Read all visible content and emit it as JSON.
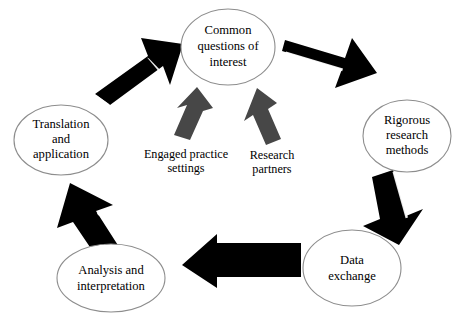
{
  "diagram": {
    "background_color": "#ffffff",
    "node_fill_color": "#ffffff",
    "node_stroke_color": "#8d8d8d",
    "arrow_color": "#000000",
    "input_arrow_color": "#474747",
    "nodes": [
      {
        "id": "common-questions",
        "label_lines": [
          "Common",
          "questions of",
          "interest"
        ],
        "position": "top-center"
      },
      {
        "id": "rigorous-research-methods",
        "label_lines": [
          "Rigorous",
          "research",
          "methods"
        ],
        "position": "right"
      },
      {
        "id": "data-exchange",
        "label_lines": [
          "Data",
          "exchange"
        ],
        "position": "bottom-right"
      },
      {
        "id": "analysis-interpretation",
        "label_lines": [
          "Analysis and",
          "interpretation"
        ],
        "position": "bottom-left"
      },
      {
        "id": "translation-application",
        "label_lines": [
          "Translation",
          "and",
          "application"
        ],
        "position": "left"
      }
    ],
    "input_labels": [
      {
        "id": "engaged-practice-settings",
        "label_lines": [
          "Engaged practice",
          "settings"
        ],
        "points_to": "common-questions"
      },
      {
        "id": "research-partners",
        "label_lines": [
          "Research",
          "partners"
        ],
        "points_to": "common-questions"
      }
    ],
    "connectors": [
      {
        "id": "arrow-questions-to-methods",
        "from": "common-questions",
        "to": "rigorous-research-methods",
        "color": "#000000"
      },
      {
        "id": "arrow-methods-to-exchange",
        "from": "rigorous-research-methods",
        "to": "data-exchange",
        "color": "#000000"
      },
      {
        "id": "arrow-exchange-to-analysis",
        "from": "data-exchange",
        "to": "analysis-interpretation",
        "color": "#000000"
      },
      {
        "id": "arrow-analysis-to-translation",
        "from": "analysis-interpretation",
        "to": "translation-application",
        "color": "#000000"
      },
      {
        "id": "arrow-translation-to-questions",
        "from": "translation-application",
        "to": "common-questions",
        "color": "#000000"
      },
      {
        "id": "arrow-engaged-practice-input",
        "from": "engaged-practice-settings",
        "to": "common-questions",
        "color": "#474747"
      },
      {
        "id": "arrow-research-partners-input",
        "from": "research-partners",
        "to": "common-questions",
        "color": "#474747"
      }
    ]
  }
}
